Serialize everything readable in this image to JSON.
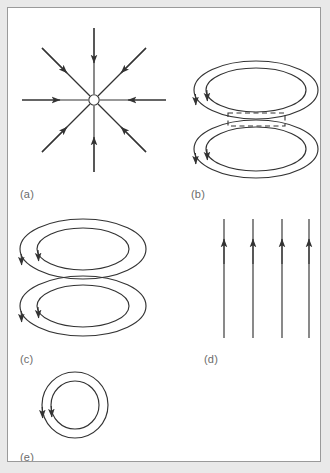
{
  "figure": {
    "background_color": "#e9e9e9",
    "plate_color": "#ffffff",
    "border_color": "#9a9a9a",
    "stroke_color": "#333333",
    "label_color": "#6b6b6b"
  },
  "labels": {
    "a": "(a)",
    "b": "(b)",
    "c": "(c)",
    "d": "(d)",
    "e": "(e)"
  },
  "panels": [
    {
      "id": "a",
      "label": "(a)",
      "type": "radial-converging-field",
      "description": "Eight straight field lines converging inward toward a small open circle at the centre",
      "center": {
        "x": 93,
        "y": 99
      },
      "center_radius": 5,
      "ray_count": 8,
      "ray_length": 72,
      "arrow_direction": "inward",
      "ray_angles_deg": [
        0,
        45,
        90,
        135,
        180,
        225,
        270,
        315
      ],
      "arrow_fraction": 0.52
    },
    {
      "id": "b",
      "label": "(b)",
      "type": "double-ellipse-loops-with-dashed-box",
      "description": "Two stacked pairs of concentric ellipses joined by a dashed rectangle, arrowheads on the left",
      "top_loops": {
        "cx": 255,
        "cy": 89,
        "outer_rx": 62,
        "outer_ry": 29,
        "inner_rx": 50,
        "inner_ry": 22
      },
      "bottom_loops": {
        "cx": 255,
        "cy": 148,
        "outer_rx": 62,
        "outer_ry": 29,
        "inner_rx": 50,
        "inner_ry": 22
      },
      "dashed_box": {
        "x": 227,
        "y": 112,
        "width": 57,
        "height": 13
      },
      "arrow_count": 4
    },
    {
      "id": "c",
      "label": "(c)",
      "type": "stacked-ellipse-loop-pairs",
      "description": "Two separated pairs of concentric ellipses, each with two arrowheads on the lower-left",
      "upper": {
        "cx": 82,
        "cy": 248,
        "outer_rx": 63,
        "outer_ry": 30,
        "inner_rx": 46,
        "inner_ry": 21
      },
      "lower": {
        "cx": 82,
        "cy": 305,
        "outer_rx": 63,
        "outer_ry": 30,
        "inner_rx": 46,
        "inner_ry": 21
      },
      "arrow_count": 4
    },
    {
      "id": "d",
      "label": "(d)",
      "type": "uniform-parallel-field",
      "description": "Four parallel vertical field lines with upward arrowheads near the top",
      "line_count": 4,
      "line_x": [
        223,
        252,
        281,
        308
      ],
      "line_top": 218,
      "line_bottom": 337,
      "arrow_y": 240,
      "arrow_direction": "up"
    },
    {
      "id": "e",
      "label": "(e)",
      "type": "concentric-circular-loops",
      "description": "A single pair of concentric circles with two arrowheads on the left",
      "center": {
        "x": 74,
        "y": 404
      },
      "outer_r": 33,
      "inner_r": 24,
      "arrow_count": 2
    }
  ]
}
